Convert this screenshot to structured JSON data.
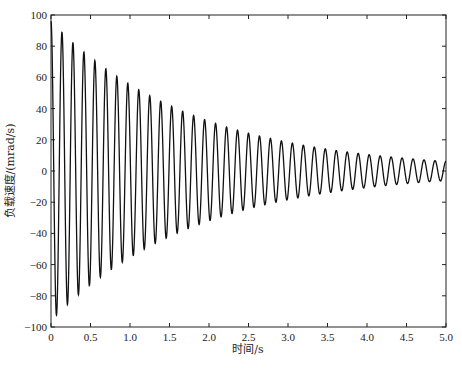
{
  "chart_data": {
    "type": "line",
    "title": "",
    "xlabel": "时间/s",
    "ylabel": "负载速度/(mrad/s)",
    "xlim": [
      0,
      5.0
    ],
    "ylim": [
      -100,
      100
    ],
    "x_ticks": [
      "0",
      "0.5",
      "1.0",
      "1.5",
      "2.0",
      "2.5",
      "3.0",
      "3.5",
      "4.0",
      "4.5",
      "5.0"
    ],
    "y_ticks": [
      "100",
      "80",
      "60",
      "40",
      "20",
      "0",
      "-20",
      "-40",
      "-60",
      "-80",
      "-100"
    ],
    "grid": false,
    "legend": null,
    "series": [
      {
        "name": "负载速度",
        "description": "Exponentially decaying sinusoidal oscillation",
        "model": {
          "amplitude": 96,
          "decay_rate": 0.55,
          "frequency_hz": 7.2,
          "phase": "cosine"
        },
        "color": "#111111",
        "peak_envelope": {
          "t": [
            0.0,
            0.5,
            1.0,
            1.5,
            2.0,
            2.5,
            3.0,
            3.5,
            4.0,
            4.5,
            5.0
          ],
          "upper": [
            96,
            74,
            56,
            43,
            33,
            25,
            19,
            14,
            11,
            8,
            6
          ],
          "lower": [
            -96,
            -74,
            -56,
            -43,
            -33,
            -25,
            -19,
            -14,
            -11,
            -8,
            -6
          ]
        }
      }
    ]
  }
}
